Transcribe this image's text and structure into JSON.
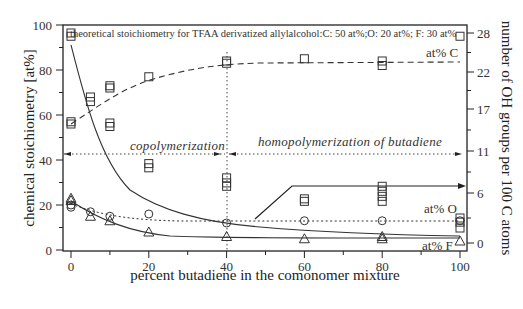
{
  "chart_data": {
    "type": "scatter",
    "title": "",
    "annotation_top": "theoretical stoichiometry for TFAA derivatized allylalcohol:C: 50 at%;O: 20 at%; F: 30 at%",
    "xlabel": "percent butadiene in the comonomer mixture",
    "ylabel": "chemical stoichiometry [at%]",
    "y2label": "number of OH groups per 100 C atoms",
    "xlim": [
      0,
      100
    ],
    "ylim": [
      0,
      100
    ],
    "y2lim": [
      0,
      28
    ],
    "xticks": [
      0,
      20,
      40,
      60,
      80,
      100
    ],
    "yticks": [
      0,
      20,
      40,
      60,
      80,
      100
    ],
    "y2ticks": [
      "0",
      "6",
      "11",
      "17",
      "22",
      "28"
    ],
    "grid": false,
    "regions": [
      {
        "label": "copolymerization",
        "x_from": 0,
        "x_to": 40
      },
      {
        "label": "homopolymerization of butadiene",
        "x_from": 40,
        "x_to": 100
      }
    ],
    "series": [
      {
        "name": "at% C",
        "marker": "square",
        "line": "dashed",
        "axis": "left",
        "x": [
          0,
          0,
          5,
          10,
          10,
          20,
          40,
          40,
          60,
          80,
          80,
          100
        ],
        "y": [
          57,
          56,
          68,
          73,
          72,
          77,
          84,
          83,
          85,
          84,
          82,
          95
        ]
      },
      {
        "name": "OH groups per 100 C",
        "marker": "square",
        "line": "solid",
        "axis": "right",
        "x": [
          0,
          0,
          5,
          10,
          10,
          20,
          20,
          40,
          40,
          40,
          60,
          60,
          80,
          80,
          80,
          80,
          100,
          100,
          100
        ],
        "y": [
          28,
          27.5,
          18,
          15,
          14.5,
          9.5,
          9,
          7.8,
          7.2,
          6.8,
          5.3,
          5,
          6.8,
          6.2,
          5.6,
          5,
          3,
          2.5,
          1.8
        ]
      },
      {
        "name": "at% O",
        "marker": "circle",
        "line": "dotted",
        "axis": "left",
        "x": [
          0,
          0,
          5,
          10,
          20,
          40,
          60,
          80,
          100
        ],
        "y": [
          20,
          19,
          17,
          15,
          16,
          12,
          13,
          13,
          13
        ]
      },
      {
        "name": "at% F",
        "marker": "triangle",
        "line": "solid",
        "axis": "left",
        "x": [
          0,
          0,
          5,
          10,
          20,
          40,
          60,
          80,
          80,
          100
        ],
        "y": [
          23,
          22,
          15,
          13,
          8,
          6,
          5,
          5,
          6,
          4
        ]
      }
    ],
    "series_labels": {
      "c": "at% C",
      "o": "at% O",
      "f": "at% F"
    },
    "legend_position": "inline labels at right"
  }
}
